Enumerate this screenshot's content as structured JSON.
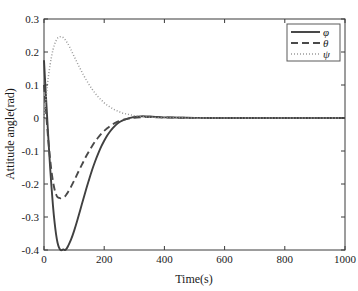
{
  "chart_data": {
    "type": "line",
    "title": "",
    "xlabel": "Time(s)",
    "ylabel": "Attitude angle(rad)",
    "xlim": [
      0,
      1000
    ],
    "ylim": [
      -0.4,
      0.3
    ],
    "xticks": [
      0,
      200,
      400,
      600,
      800,
      1000
    ],
    "xticklabels": [
      "0",
      "200",
      "400",
      "600",
      "800",
      "1000"
    ],
    "yticks": [
      0.3,
      0.2,
      0.1,
      0,
      -0.1,
      -0.2,
      -0.3,
      -0.4
    ],
    "yticklabels": [
      "0.3",
      "0.2",
      "0.1",
      "0",
      "-0.1",
      "-0.2",
      "-0.3",
      "-0.4"
    ],
    "grid": false,
    "legend_position": "upper right",
    "legend_entries": [
      "φ",
      "θ",
      "ψ"
    ],
    "x": [
      0,
      5,
      10,
      15,
      20,
      25,
      30,
      35,
      40,
      45,
      50,
      55,
      60,
      65,
      70,
      75,
      80,
      90,
      100,
      110,
      120,
      130,
      140,
      150,
      160,
      170,
      180,
      190,
      200,
      210,
      220,
      230,
      240,
      250,
      260,
      270,
      280,
      290,
      300,
      320,
      340,
      360,
      380,
      400,
      450,
      500,
      550,
      600,
      700,
      800,
      900,
      1000
    ],
    "series": [
      {
        "name": "φ",
        "style": "solid",
        "color": "#404040",
        "width": 1.9,
        "values": [
          0.175,
          0.09,
          0.01,
          -0.07,
          -0.145,
          -0.21,
          -0.268,
          -0.315,
          -0.352,
          -0.378,
          -0.393,
          -0.4,
          -0.4,
          -0.398,
          -0.4,
          -0.396,
          -0.388,
          -0.368,
          -0.342,
          -0.312,
          -0.28,
          -0.248,
          -0.216,
          -0.186,
          -0.157,
          -0.131,
          -0.108,
          -0.087,
          -0.069,
          -0.053,
          -0.04,
          -0.029,
          -0.02,
          -0.013,
          -0.008,
          -0.004,
          -0.001,
          0.001,
          0.003,
          0.005,
          0.005,
          0.004,
          0.003,
          0.002,
          0.001,
          0.0005,
          0.0002,
          0.0001,
          0,
          0,
          0,
          0
        ]
      },
      {
        "name": "θ",
        "style": "dashed",
        "color": "#4a4a4a",
        "width": 1.9,
        "values": [
          0.1,
          0.04,
          -0.02,
          -0.075,
          -0.122,
          -0.162,
          -0.193,
          -0.216,
          -0.231,
          -0.24,
          -0.242,
          -0.243,
          -0.241,
          -0.24,
          -0.237,
          -0.231,
          -0.224,
          -0.208,
          -0.19,
          -0.171,
          -0.152,
          -0.134,
          -0.116,
          -0.1,
          -0.085,
          -0.071,
          -0.059,
          -0.048,
          -0.039,
          -0.031,
          -0.024,
          -0.018,
          -0.013,
          -0.009,
          -0.006,
          -0.004,
          -0.002,
          -0.001,
          0.0005,
          0.002,
          0.003,
          0.003,
          0.002,
          0.0015,
          0.0008,
          0.0004,
          0.0002,
          0.0001,
          0,
          0,
          0,
          0
        ]
      },
      {
        "name": "ψ",
        "style": "dotted",
        "color": "#9a9a9a",
        "width": 1.5,
        "values": [
          0.0,
          0.045,
          0.09,
          0.128,
          0.16,
          0.186,
          0.207,
          0.223,
          0.234,
          0.242,
          0.2455,
          0.2465,
          0.2455,
          0.243,
          0.238,
          0.231,
          0.224,
          0.206,
          0.187,
          0.168,
          0.15,
          0.132,
          0.116,
          0.101,
          0.087,
          0.075,
          0.064,
          0.055,
          0.046,
          0.039,
          0.033,
          0.027,
          0.023,
          0.019,
          0.015,
          0.013,
          0.011,
          0.009,
          0.007,
          0.005,
          0.003,
          0.002,
          0.0015,
          0.001,
          0.0005,
          0.0002,
          0.0001,
          0,
          0,
          0,
          0,
          0
        ]
      }
    ]
  },
  "axes": {
    "xlabel": "Time(s)",
    "ylabel": "Attitude angle(rad)"
  }
}
